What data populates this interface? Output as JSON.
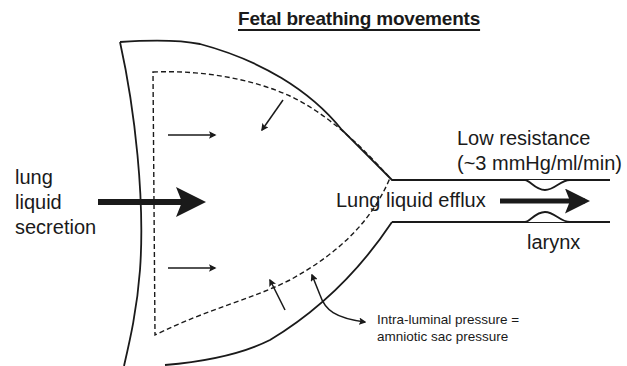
{
  "diagram": {
    "title": "Fetal breathing movements",
    "labels": {
      "secretion_line1": "lung",
      "secretion_line2": "liquid",
      "secretion_line3": "secretion",
      "efflux": "Lung liquid efflux",
      "resistance_line1": "Low resistance",
      "resistance_line2": "(~3 mmHg/ml/min)",
      "larynx": "larynx",
      "pressure_line1": "Intra-luminal pressure =",
      "pressure_line2": "amniotic sac pressure"
    },
    "colors": {
      "ink": "#1a1a1a",
      "background": "#ffffff"
    }
  }
}
